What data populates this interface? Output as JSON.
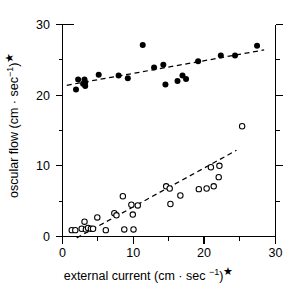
{
  "chart_data": {
    "type": "scatter",
    "title": "",
    "xlabel": "external current (cm · sec −1)*",
    "ylabel": "oscular flow (cm · sec −1)*",
    "xlim": [
      0,
      30
    ],
    "ylim": [
      0,
      30
    ],
    "xticks": [
      0,
      10,
      20,
      30
    ],
    "yticks": [
      0,
      10,
      20,
      30
    ],
    "xticklabels": [
      "0",
      "10",
      "20",
      "30"
    ],
    "yticklabels": [
      "0",
      "10",
      "20",
      "30"
    ],
    "x_minor_ticks": [
      5,
      15,
      25
    ],
    "y_minor_ticks": [
      5,
      15,
      25
    ],
    "grid": false,
    "legend": "none",
    "series": [
      {
        "name": "filled-circles",
        "marker": "filled circle",
        "color": "#000000",
        "points": [
          [
            1.9,
            20.8
          ],
          [
            2.2,
            22.2
          ],
          [
            2.9,
            21.6
          ],
          [
            3.1,
            22.2
          ],
          [
            3.2,
            21.8
          ],
          [
            3.2,
            21.3
          ],
          [
            5.1,
            22.9
          ],
          [
            7.9,
            22.8
          ],
          [
            9.2,
            22.4
          ],
          [
            11.3,
            27.1
          ],
          [
            12.9,
            23.9
          ],
          [
            14.2,
            24.3
          ],
          [
            14.5,
            21.5
          ],
          [
            16.2,
            22.0
          ],
          [
            16.9,
            22.8
          ],
          [
            17.4,
            22.3
          ],
          [
            19.1,
            24.8
          ],
          [
            22.3,
            25.6
          ],
          [
            24.3,
            25.6
          ],
          [
            27.4,
            27.0
          ]
        ],
        "trend": {
          "x0": 0.6,
          "y0": 21.4,
          "x1": 28.4,
          "y1": 26.4
        }
      },
      {
        "name": "open-circles",
        "marker": "open circle",
        "color": "#000000",
        "points": [
          [
            1.3,
            0.9
          ],
          [
            1.8,
            0.9
          ],
          [
            2.7,
            1.1
          ],
          [
            3.1,
            2.1
          ],
          [
            3.3,
            1.0
          ],
          [
            3.6,
            1.2
          ],
          [
            4.0,
            1.1
          ],
          [
            4.3,
            1.1
          ],
          [
            4.9,
            2.7
          ],
          [
            6.1,
            0.9
          ],
          [
            7.3,
            3.3
          ],
          [
            7.6,
            3.0
          ],
          [
            8.5,
            5.7
          ],
          [
            8.7,
            1.0
          ],
          [
            9.7,
            4.5
          ],
          [
            9.9,
            3.1
          ],
          [
            10.0,
            1.0
          ],
          [
            10.6,
            4.4
          ],
          [
            14.6,
            7.1
          ],
          [
            15.1,
            6.8
          ],
          [
            15.2,
            4.6
          ],
          [
            16.6,
            5.8
          ],
          [
            19.2,
            6.7
          ],
          [
            20.3,
            6.8
          ],
          [
            20.9,
            9.8
          ],
          [
            21.3,
            7.1
          ],
          [
            22.0,
            8.4
          ],
          [
            22.1,
            10.0
          ],
          [
            25.3,
            15.6
          ]
        ],
        "trend": {
          "x0": 2.0,
          "y0": -0.2,
          "x1": 24.5,
          "y1": 12.2
        }
      }
    ]
  }
}
